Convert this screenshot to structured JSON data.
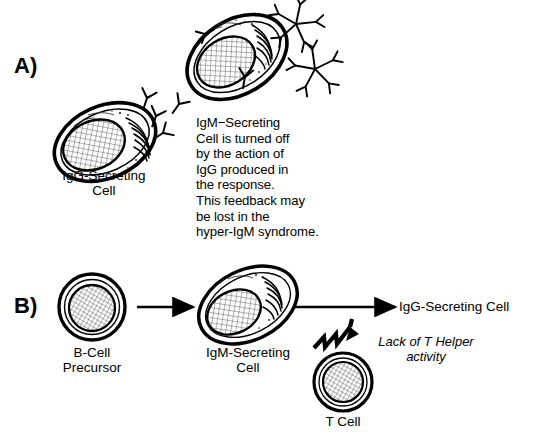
{
  "figure": {
    "type": "scientific-diagram",
    "background_color": "#ffffff",
    "ink_color": "#000000"
  },
  "panel_a": {
    "label": "A)",
    "igg_cell_label": "IgG-Secreting\nCell",
    "igm_cell_label": "IgM-Secreting",
    "caption": "IgM−Secreting\nCell is turned off\nby the action of\nIgG produced in\nthe response.\nThis feedback may\nbe lost in the\nhyper-IgM syndrome.",
    "caption_lines": [
      "IgM−Secreting",
      "Cell is turned off",
      "by the action of",
      "IgG produced in",
      "the response.",
      "This feedback may",
      "be lost in the",
      "hyper-IgM syndrome."
    ],
    "igg_antibody_count": 4,
    "igm_pentamer_count": 2,
    "icons": {
      "igg_antibody": "antibody-y-icon",
      "igm_pentamer": "igm-pentamer-icon",
      "plasma_cell": "plasma-cell-icon"
    }
  },
  "panel_b": {
    "label": "B)",
    "b_cell_precursor_label": "B-Cell\nPrecursor",
    "igm_secreting_cell_label": "IgM-Secreting\nCell",
    "igg_secreting_cell_label": "IgG-Secreting Cell",
    "t_cell_label": "T Cell",
    "lack_note": "Lack of T Helper\nactivity",
    "icons": {
      "arrow": "right-arrow-icon",
      "lightning": "lightning-bolt-arrow-icon",
      "b_cell": "b-cell-icon",
      "t_cell": "t-cell-icon",
      "plasma_cell": "plasma-cell-icon"
    }
  }
}
